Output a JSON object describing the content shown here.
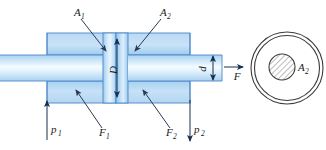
{
  "figure": {
    "labels": {
      "area_piston": "A",
      "area_piston_sub": "1",
      "area_annulus": "A",
      "area_annulus_sub": "2",
      "bore_diameter": "D",
      "rod_diameter": "d",
      "force_out": "F",
      "force_left": "F",
      "force_left_sub": "1",
      "force_right": "F",
      "force_right_sub": "2",
      "pressure_left": "p",
      "pressure_left_sub": "1",
      "pressure_right": "p",
      "pressure_right_sub": "2",
      "section_area": "A",
      "section_area_sub": "2"
    },
    "colors": {
      "body_fill_light": "#cfe4f7",
      "body_fill_mid": "#9ecbee",
      "rod_highlight": "#f2f9ff",
      "outline": "#4a86c8",
      "leader": "#2b3a52",
      "dimension": "#16314e",
      "section_stroke": "#3d3d3d",
      "background": "#ffffff"
    },
    "geometry": {
      "cylinder_block_x": [
        47,
        190
      ],
      "cylinder_block_y": [
        33,
        103
      ],
      "piston_x": [
        103,
        128
      ],
      "rod_left_x": [
        0,
        47
      ],
      "rod_right_x": [
        128,
        222
      ],
      "rod_y": [
        55,
        81
      ],
      "section_center": [
        287,
        68
      ],
      "section_outer_radius": 36,
      "section_inner_radius": 12
    }
  }
}
